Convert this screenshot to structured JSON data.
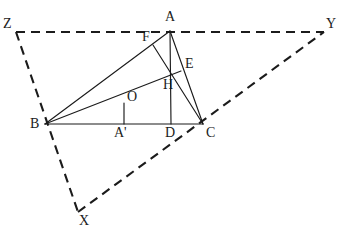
{
  "figure": {
    "width": 342,
    "height": 238,
    "background_color": "#ffffff",
    "line_color": "#1b1b1b"
  },
  "points": {
    "A": {
      "label": "A",
      "x": 170,
      "y": 31,
      "label_x": 165,
      "label_y": 10
    },
    "B": {
      "label": "B",
      "x": 45,
      "y": 124,
      "label_x": 30,
      "label_y": 118
    },
    "C": {
      "label": "C",
      "x": 203,
      "y": 124,
      "label_x": 206,
      "label_y": 126
    },
    "D": {
      "label": "D",
      "x": 171,
      "y": 124,
      "label_x": 166,
      "label_y": 126
    },
    "E": {
      "label": "E",
      "x": 181,
      "y": 71,
      "label_x": 186,
      "label_y": 58
    },
    "F": {
      "label": "F",
      "x": 153,
      "y": 45,
      "label_x": 143,
      "label_y": 31
    },
    "H": {
      "label": "H",
      "x": 171,
      "y": 76,
      "label_x": 164,
      "label_y": 79
    },
    "O": {
      "label": "O",
      "x": 124,
      "y": 104,
      "label_x": 128,
      "label_y": 91
    },
    "A'": {
      "label": "A'",
      "x": 124,
      "y": 124,
      "label_x": 117,
      "label_y": 126
    },
    "X": {
      "label": "X",
      "x": 78,
      "y": 212,
      "label_x": 80,
      "label_y": 215
    },
    "Y": {
      "label": "Y",
      "x": 324,
      "y": 32,
      "label_x": 327,
      "label_y": 17
    },
    "Z": {
      "label": "Z",
      "x": 16,
      "y": 32,
      "label_x": 4,
      "label_y": 18
    }
  },
  "segments": {
    "solid": [
      {
        "name": "side-BC",
        "from": "B",
        "to": "C"
      },
      {
        "name": "side-BA",
        "from": "B",
        "to": "A"
      },
      {
        "name": "side-AC",
        "from": "A",
        "to": "C"
      },
      {
        "name": "altitude-AD",
        "from": "A",
        "to": "D"
      },
      {
        "name": "altitude-BE",
        "from": "B",
        "to": "E"
      },
      {
        "name": "altitude-CF",
        "from": "C",
        "to": "F"
      },
      {
        "name": "perpendicular-bisector-OA-prime",
        "from": "A'",
        "to": "O"
      }
    ],
    "dashed": [
      {
        "name": "tangent-line-ZY",
        "from": "Z",
        "to": "Y",
        "through": "A"
      },
      {
        "name": "tangent-line-ZX",
        "from": "Z",
        "to": "X",
        "through": "B"
      },
      {
        "name": "tangent-line-XY",
        "from": "X",
        "to": "Y",
        "through": "C"
      }
    ]
  },
  "labels": [
    {
      "name": "vertex-label-A",
      "text": "A",
      "x": 165,
      "y": 10
    },
    {
      "name": "vertex-label-B",
      "text": "B",
      "x": 30,
      "y": 117
    },
    {
      "name": "vertex-label-C",
      "text": "C",
      "x": 206,
      "y": 126
    },
    {
      "name": "vertex-label-D",
      "text": "D",
      "x": 165,
      "y": 126
    },
    {
      "name": "vertex-label-E",
      "text": "E",
      "x": 185,
      "y": 57
    },
    {
      "name": "vertex-label-F",
      "text": "F",
      "x": 142,
      "y": 30
    },
    {
      "name": "vertex-label-H",
      "text": "H",
      "x": 163,
      "y": 78
    },
    {
      "name": "vertex-label-O",
      "text": "O",
      "x": 127,
      "y": 90
    },
    {
      "name": "vertex-label-A-prime",
      "text": "A'",
      "x": 114,
      "y": 126
    },
    {
      "name": "vertex-label-X",
      "text": "X",
      "x": 79,
      "y": 214
    },
    {
      "name": "vertex-label-Y",
      "text": "Y",
      "x": 326,
      "y": 17
    },
    {
      "name": "vertex-label-Z",
      "text": "Z",
      "x": 3,
      "y": 17
    }
  ]
}
